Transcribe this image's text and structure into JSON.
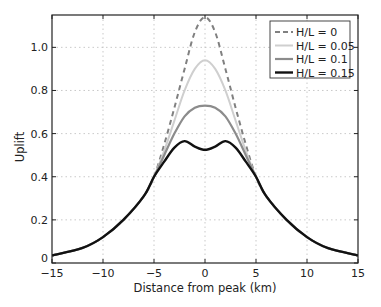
{
  "chart_data": {
    "type": "line",
    "title": "",
    "xlabel": "Distance from peak (km)",
    "ylabel": "Uplift",
    "xlim": [
      -15,
      15
    ],
    "ylim": [
      0,
      1.15
    ],
    "xticks": [
      -15,
      -10,
      -5,
      0,
      5,
      10,
      15
    ],
    "xtick_labels": [
      "−15",
      "−10",
      "−5",
      "0",
      "5",
      "10",
      "15"
    ],
    "yticks": [
      0,
      0.2,
      0.4,
      0.6,
      0.8,
      1.0
    ],
    "ytick_labels": [
      "0",
      "0.2",
      "0.4",
      "0.6",
      "0.8",
      "1.0"
    ],
    "grid": true,
    "legend_position": "upper right",
    "x": [
      -15,
      -12,
      -10,
      -8,
      -6,
      -5,
      -4,
      -3,
      -2,
      -1,
      0,
      1,
      2,
      3,
      4,
      5,
      6,
      8,
      10,
      12,
      15
    ],
    "series": [
      {
        "name": "H/L = 0",
        "color": "#808080",
        "style": "dashed",
        "width": 2,
        "values": [
          0.035,
          0.07,
          0.12,
          0.2,
          0.31,
          0.4,
          0.55,
          0.72,
          0.9,
          1.07,
          1.14,
          1.07,
          0.9,
          0.72,
          0.55,
          0.4,
          0.31,
          0.2,
          0.12,
          0.07,
          0.035
        ]
      },
      {
        "name": "H/L = 0.05",
        "color": "#cfcfcf",
        "style": "solid",
        "width": 2,
        "values": [
          0.035,
          0.07,
          0.12,
          0.2,
          0.31,
          0.4,
          0.52,
          0.66,
          0.8,
          0.9,
          0.94,
          0.9,
          0.8,
          0.66,
          0.52,
          0.4,
          0.31,
          0.2,
          0.12,
          0.07,
          0.035
        ]
      },
      {
        "name": "H/L = 0.1",
        "color": "#8c8c8c",
        "style": "solid",
        "width": 2.2,
        "values": [
          0.035,
          0.07,
          0.12,
          0.2,
          0.31,
          0.4,
          0.5,
          0.6,
          0.68,
          0.72,
          0.73,
          0.72,
          0.68,
          0.6,
          0.5,
          0.4,
          0.31,
          0.2,
          0.12,
          0.07,
          0.035
        ]
      },
      {
        "name": "H/L = 0.15",
        "color": "#111111",
        "style": "solid",
        "width": 2.4,
        "values": [
          0.035,
          0.07,
          0.12,
          0.2,
          0.31,
          0.4,
          0.47,
          0.535,
          0.565,
          0.54,
          0.525,
          0.54,
          0.565,
          0.535,
          0.47,
          0.4,
          0.31,
          0.2,
          0.12,
          0.07,
          0.035
        ]
      }
    ]
  },
  "layout": {
    "plot_left": 52,
    "plot_right": 358,
    "plot_top": 15,
    "plot_bottom": 263
  }
}
